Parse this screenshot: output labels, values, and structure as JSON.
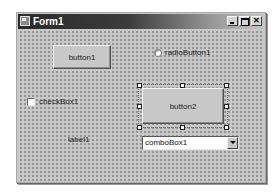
{
  "window": {
    "title": "Form1",
    "controls": {
      "minimize_icon": "minimize-icon",
      "maximize_icon": "maximize-icon",
      "close_icon": "close-icon",
      "close_glyph": "✕"
    }
  },
  "form": {
    "button1": {
      "label": "button1"
    },
    "button2": {
      "label": "button2",
      "selected": true
    },
    "radioButton1": {
      "label": "radioButton1",
      "checked": false
    },
    "checkBox1": {
      "label": "checkBox1",
      "checked": false
    },
    "label1": {
      "text": "label1"
    },
    "comboBox1": {
      "value": "comboBox1"
    }
  },
  "colors": {
    "form_background": "#c8c8c8",
    "titlebar_dark": "#2a2a2a",
    "grid_dot": "#6a6a6a"
  }
}
